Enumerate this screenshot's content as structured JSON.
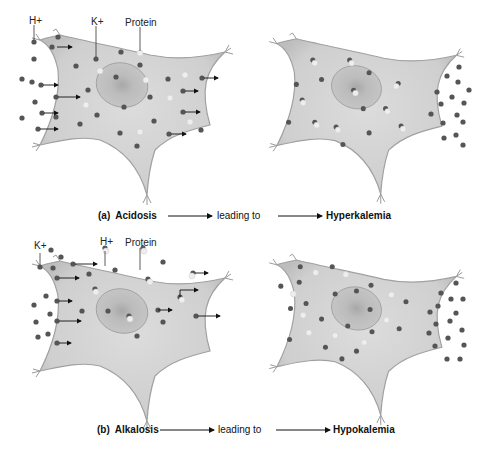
{
  "panels": [
    {
      "id": "a",
      "caption": {
        "letter": "(a)",
        "condition": "Acidosis",
        "connector": "leading to",
        "result": "Hyperkalemia"
      },
      "labels": {
        "ion1": "H+",
        "ion2": "K+",
        "protein": "Protein"
      },
      "description": "H+ moves into cell, K+ moves out of cell"
    },
    {
      "id": "b",
      "caption": {
        "letter": "(b)",
        "condition": "Alkalosis",
        "connector": "leading to",
        "result": "Hypokalemia"
      },
      "labels": {
        "ion1": "K+",
        "ion2": "H+",
        "protein": "Protein"
      },
      "description": "K+ moves into cell, H+ moves out of cell"
    }
  ],
  "colors": {
    "cell_fill": "#d4d4d4",
    "cell_edge": "#9a9a9a",
    "nucleus": "#b8b8b8",
    "ion_dot": "#555555",
    "protein_dot": "#f0f0f0"
  }
}
